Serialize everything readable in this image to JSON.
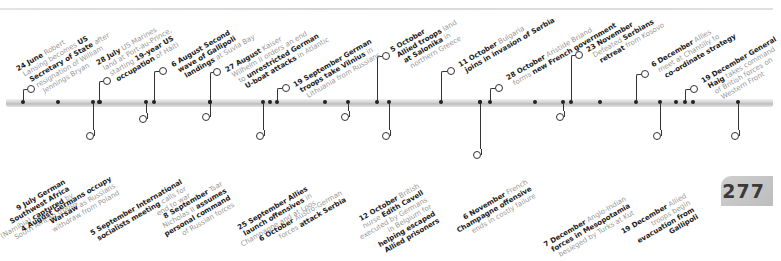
{
  "page": {
    "number": "277"
  },
  "timeline": {
    "above": [
      {
        "id": "e1",
        "date": "24 June",
        "lines": [
          [
            {
              "t": "24 June",
              "b": true
            },
            {
              "t": " Robert",
              "b": false
            }
          ],
          [
            {
              "t": "Lansing becomes ",
              "b": false
            },
            {
              "t": "US",
              "b": true
            }
          ],
          [
            {
              "t": "Secretary of State",
              "b": true
            },
            {
              "t": " after",
              "b": false
            }
          ],
          [
            {
              "t": "resignation of William",
              "b": false
            }
          ],
          [
            {
              "t": "Jennings Bryan",
              "b": false
            }
          ]
        ]
      },
      {
        "id": "e2",
        "date": "28 July",
        "lines": [
          [
            {
              "t": "28 July",
              "b": true
            },
            {
              "t": " US Marines",
              "b": false
            }
          ],
          [
            {
              "t": "land at Port-au-Prince,",
              "b": false
            }
          ],
          [
            {
              "t": "starting ",
              "b": false
            },
            {
              "t": "19-year US",
              "b": true
            }
          ],
          [
            {
              "t": "occupation",
              "b": true
            },
            {
              "t": " of Haiti",
              "b": false
            }
          ]
        ]
      },
      {
        "id": "e3",
        "date": "6 August",
        "lines": [
          [
            {
              "t": "6 August Second",
              "b": true
            }
          ],
          [
            {
              "t": "wave of Gallipoli",
              "b": true
            }
          ],
          [
            {
              "t": "landings",
              "b": true
            },
            {
              "t": " at Suvla Bay",
              "b": false
            }
          ]
        ]
      },
      {
        "id": "e4",
        "date": "27 August",
        "lines": [
          [
            {
              "t": "27 August",
              "b": true
            },
            {
              "t": " Kaiser",
              "b": false
            }
          ],
          [
            {
              "t": "Wilhelm II orders an end",
              "b": false
            }
          ],
          [
            {
              "t": "to ",
              "b": false
            },
            {
              "t": "unrestricted German",
              "b": true
            }
          ],
          [
            {
              "t": "U-boat attacks",
              "b": true
            },
            {
              "t": " in Atlantic",
              "b": false
            }
          ]
        ]
      },
      {
        "id": "e5",
        "date": "19 September",
        "lines": [
          [
            {
              "t": "19 September German",
              "b": true
            }
          ],
          [
            {
              "t": "troops take Vilnius",
              "b": true
            },
            {
              "t": " in",
              "b": false
            }
          ],
          [
            {
              "t": "Lithuania from Russians",
              "b": false
            }
          ]
        ]
      },
      {
        "id": "e6",
        "date": "5 October",
        "lines": [
          [
            {
              "t": "5 October",
              "b": true
            }
          ],
          [
            {
              "t": "Allied troops",
              "b": true
            },
            {
              "t": " land",
              "b": false
            }
          ],
          [
            {
              "t": "at Salonika",
              "b": true
            },
            {
              "t": " in",
              "b": false
            }
          ],
          [
            {
              "t": "northern Greece",
              "b": false
            }
          ]
        ]
      },
      {
        "id": "e7",
        "date": "11 October",
        "lines": [
          [
            {
              "t": "11 October",
              "b": true
            },
            {
              "t": " Bulgaria",
              "b": false
            }
          ],
          [
            {
              "t": "joins in invasion of Serbia",
              "b": true
            }
          ]
        ]
      },
      {
        "id": "e8",
        "date": "28 October",
        "lines": [
          [
            {
              "t": "28 October",
              "b": true
            },
            {
              "t": " Aristide Briand",
              "b": false
            }
          ],
          [
            {
              "t": "forms ",
              "b": false
            },
            {
              "t": "new French government",
              "b": true
            }
          ]
        ]
      },
      {
        "id": "e9",
        "date": "23 November",
        "lines": [
          [
            {
              "t": "23 November",
              "b": true
            }
          ],
          [
            {
              "t": "Defeated ",
              "b": false
            },
            {
              "t": "Serbians",
              "b": true
            }
          ],
          [
            {
              "t": "retreat",
              "b": true
            },
            {
              "t": " from Kosovo",
              "b": false
            }
          ]
        ]
      },
      {
        "id": "e10",
        "date": "6 December",
        "lines": [
          [
            {
              "t": "6 December",
              "b": true
            },
            {
              "t": " Allies",
              "b": false
            }
          ],
          [
            {
              "t": "meet at Chantilly to",
              "b": false
            }
          ],
          [
            {
              "t": "co-ordinate strategy",
              "b": true
            }
          ]
        ]
      },
      {
        "id": "e11",
        "date": "19 December",
        "lines": [
          [
            {
              "t": "19 December General",
              "b": true
            }
          ],
          [
            {
              "t": "Haig",
              "b": true
            },
            {
              "t": " takes command",
              "b": false
            }
          ],
          [
            {
              "t": "of British forces on",
              "b": false
            }
          ],
          [
            {
              "t": "Western Front",
              "b": false
            }
          ]
        ]
      }
    ],
    "below": [
      {
        "id": "b1",
        "date": "9 July",
        "lines": [
          [
            {
              "t": "9 July German",
              "b": true
            }
          ],
          [
            {
              "t": "Southwest Africa",
              "b": true
            }
          ],
          [
            {
              "t": "(Namibia) ",
              "b": false
            },
            {
              "t": "captured",
              "b": true
            },
            {
              "t": " by",
              "b": false
            }
          ],
          [
            {
              "t": "South African troops",
              "b": false
            }
          ]
        ]
      },
      {
        "id": "b2",
        "date": "4 August",
        "lines": [
          [
            {
              "t": "4 August Germans occupy",
              "b": true
            }
          ],
          [
            {
              "t": "Warsaw",
              "b": true
            },
            {
              "t": " as Russians",
              "b": false
            }
          ],
          [
            {
              "t": "withdraw from Poland",
              "b": false
            }
          ]
        ]
      },
      {
        "id": "b3",
        "date": "5 September",
        "lines": [
          [
            {
              "t": "5 September International",
              "b": true
            }
          ],
          [
            {
              "t": "socialists meeting",
              "b": true
            },
            {
              "t": " calls for",
              "b": false
            }
          ],
          [
            {
              "t": "end to war",
              "b": false
            }
          ]
        ]
      },
      {
        "id": "b4",
        "date": "8 September",
        "lines": [
          [
            {
              "t": "8 September",
              "b": true
            },
            {
              "t": " Tsar",
              "b": false
            }
          ],
          [
            {
              "t": "Nicholas II ",
              "b": false
            },
            {
              "t": "assumes",
              "b": true
            }
          ],
          [
            {
              "t": "personal command",
              "b": true
            }
          ],
          [
            {
              "t": "of Russian forces",
              "b": false
            }
          ]
        ]
      },
      {
        "id": "b5",
        "date": "25 September",
        "lines": [
          [
            {
              "t": "25 September Allies",
              "b": true
            }
          ],
          [
            {
              "t": "launch offensives",
              "b": true
            },
            {
              "t": " in",
              "b": false
            }
          ],
          [
            {
              "t": "Champagne and at Loos",
              "b": false
            }
          ]
        ]
      },
      {
        "id": "b6",
        "date": "6 October",
        "lines": [
          [
            {
              "t": "6 October",
              "b": true
            },
            {
              "t": " Austro-German",
              "b": false
            }
          ],
          [
            {
              "t": "forces ",
              "b": false
            },
            {
              "t": "attack Serbia",
              "b": true
            }
          ]
        ]
      },
      {
        "id": "b7",
        "date": "12 October",
        "lines": [
          [
            {
              "t": "12 October",
              "b": true
            },
            {
              "t": " British",
              "b": false
            }
          ],
          [
            {
              "t": "nurse ",
              "b": false
            },
            {
              "t": "Edith Cavell",
              "b": true
            }
          ],
          [
            {
              "t": "executed by Germans",
              "b": false
            }
          ],
          [
            {
              "t": "in Belgium for",
              "b": false
            }
          ],
          [
            {
              "t": "helping escaped",
              "b": true
            }
          ],
          [
            {
              "t": "Allied prisoners",
              "b": true
            }
          ]
        ]
      },
      {
        "id": "b8",
        "date": "6 November",
        "lines": [
          [
            {
              "t": "6 November",
              "b": true
            },
            {
              "t": " French",
              "b": false
            }
          ],
          [
            {
              "t": "Champagne offensive",
              "b": true
            }
          ],
          [
            {
              "t": "ends in costly failure",
              "b": false
            }
          ]
        ]
      },
      {
        "id": "b9",
        "date": "7 December",
        "lines": [
          [
            {
              "t": "7 December",
              "b": true
            },
            {
              "t": " Anglo-Indian",
              "b": false
            }
          ],
          [
            {
              "t": "forces in Mesopotamia",
              "b": true
            }
          ],
          [
            {
              "t": "besieged by Turks at Kut",
              "b": false
            }
          ]
        ]
      },
      {
        "id": "b10",
        "date": "19 December",
        "lines": [
          [
            {
              "t": "19 December",
              "b": true
            },
            {
              "t": " Allied",
              "b": false
            }
          ],
          [
            {
              "t": "troops begin",
              "b": false
            }
          ],
          [
            {
              "t": "evacuation from",
              "b": true
            }
          ],
          [
            {
              "t": "Gallipoli",
              "b": true
            }
          ]
        ]
      }
    ]
  }
}
